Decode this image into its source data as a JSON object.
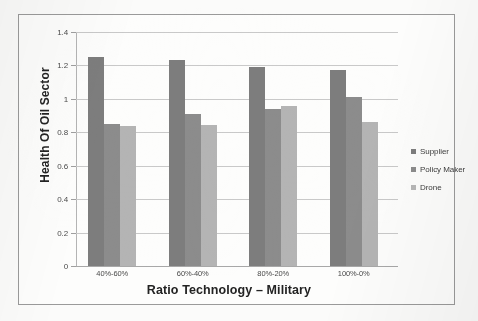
{
  "chart_data": {
    "type": "bar",
    "title": "",
    "subtitle": "",
    "xlabel": "Ratio Technology – Military",
    "ylabel": "Health Of Oil Sector",
    "categories": [
      "40%-60%",
      "60%-40%",
      "80%-20%",
      "100%-0%"
    ],
    "series": [
      {
        "name": "Supplier",
        "color": "#7d7d7d",
        "values": [
          1.25,
          1.23,
          1.19,
          1.17
        ]
      },
      {
        "name": "Policy Maker",
        "color": "#8c8c8c",
        "values": [
          0.85,
          0.91,
          0.94,
          1.01
        ]
      },
      {
        "name": "Drone",
        "color": "#b4b4b4",
        "values": [
          0.84,
          0.845,
          0.955,
          0.86
        ]
      }
    ],
    "ylim": [
      0,
      1.4
    ],
    "yticks": [
      0,
      0.2,
      0.4,
      0.6,
      0.8,
      1,
      1.2,
      1.4
    ],
    "ytick_labels": [
      "0",
      "0.2",
      "0.4",
      "0.6",
      "0.8",
      "1",
      "1.2",
      "1.4"
    ],
    "grid": true,
    "grid_axis": "y",
    "legend_position": "right",
    "bar_orientation": "vertical",
    "grouped": true
  },
  "legend": {
    "entries": [
      {
        "label": "Supplier"
      },
      {
        "label": "Policy Maker"
      },
      {
        "label": "Drone"
      }
    ]
  },
  "axes": {
    "x_title": "Ratio Technology – Military",
    "y_title": "Health Of Oil Sector"
  }
}
